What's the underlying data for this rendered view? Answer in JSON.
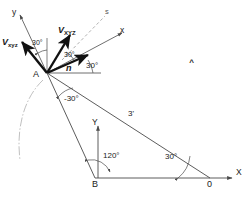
{
  "diagram": {
    "points": [
      {
        "id": "A",
        "label": "A",
        "x": 47,
        "y": 73
      },
      {
        "id": "B",
        "label": "B",
        "x": 95,
        "y": 178
      },
      {
        "id": "O",
        "label": "0",
        "x": 210,
        "y": 178
      }
    ],
    "axes": [
      {
        "id": "y-local",
        "label": "y"
      },
      {
        "id": "x-local",
        "label": "x"
      },
      {
        "id": "Y-global",
        "label": "Y"
      },
      {
        "id": "X-global",
        "label": "X"
      }
    ],
    "vectors": [
      {
        "id": "v-lower",
        "name": "V",
        "sub": "xyz",
        "angle_deg": 135
      },
      {
        "id": "v-upper",
        "name": "V",
        "sub": "XYZ",
        "angle_deg": 65
      },
      {
        "id": "n-hat",
        "name": "n",
        "hat": "^",
        "angle_deg": 30
      }
    ],
    "reference_line": {
      "id": "s-line",
      "label": "s",
      "style": "dashed"
    },
    "angles": [
      {
        "id": "angle-vxyz-y",
        "label": "30°"
      },
      {
        "id": "angle-vXYZ-n",
        "label": "30°"
      },
      {
        "id": "angle-n-horizontal",
        "label": "30°"
      },
      {
        "id": "angle-below-A",
        "label": "-30°"
      },
      {
        "id": "angle-at-B",
        "label": "120°"
      },
      {
        "id": "angle-at-O",
        "label": "30°"
      }
    ],
    "dimensions": [
      {
        "id": "side-AO",
        "label": "3'"
      }
    ],
    "colors": {
      "stroke": "#1a1a1a",
      "thin": "#4a4a4a",
      "faint": "#a9a9a9",
      "background": "#ffffff"
    }
  }
}
